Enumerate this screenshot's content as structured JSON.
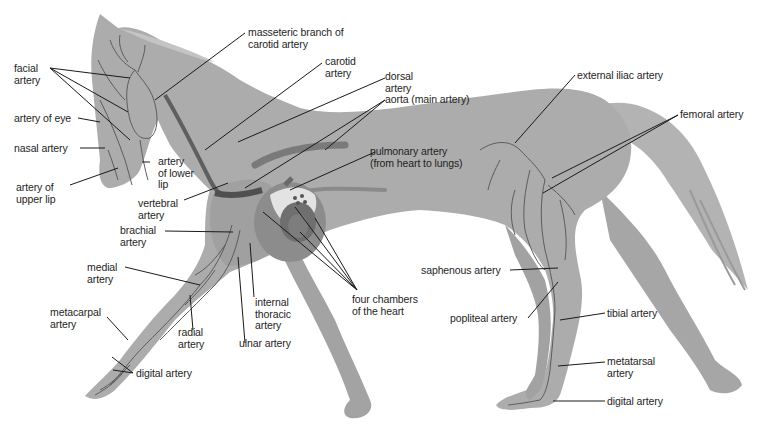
{
  "diagram": {
    "colors": {
      "body": "#a9a9a9",
      "body_dark": "#8f8f8f",
      "artery": "#5a5a5a",
      "leader_line": "#1a1a1a",
      "heart_light": "#e6e6e6",
      "heart_dark": "#6e6e6e",
      "background": "#ffffff"
    },
    "labels": {
      "facial_artery": "facial\nartery",
      "artery_of_eye": "artery of eye",
      "nasal_artery": "nasal artery",
      "artery_of_upper_lip": "artery of\nupper lip",
      "artery_of_lower_lip": "artery\nof lower\nlip",
      "vertebral_artery": "vertebral\nartery",
      "masseteric_branch": "masseteric branch of\ncarotid artery",
      "carotid_artery": "carotid\nartery",
      "dorsal_artery": "dorsal\nartery",
      "aorta": "aorta (main artery)",
      "pulmonary_artery": "pulmonary artery\n(from heart to lungs)",
      "external_iliac_artery": "external iliac artery",
      "femoral_artery": "femoral artery",
      "brachial_artery": "brachial\nartery",
      "medial_artery": "medial\nartery",
      "metacarpal_artery": "metacarpal\nartery",
      "radial_artery": "radial\nartery",
      "internal_thoracic_artery": "internal\nthoracic\nartery",
      "ulnar_artery": "ulnar artery",
      "digital_artery_front": "digital artery",
      "four_chambers": "four chambers\nof the heart",
      "saphenous_artery": "saphenous artery",
      "popliteal_artery": "popliteal artery",
      "tibial_artery": "tibial artery",
      "metatarsal_artery": "metatarsal\nartery",
      "digital_artery_hind": "digital artery"
    }
  }
}
